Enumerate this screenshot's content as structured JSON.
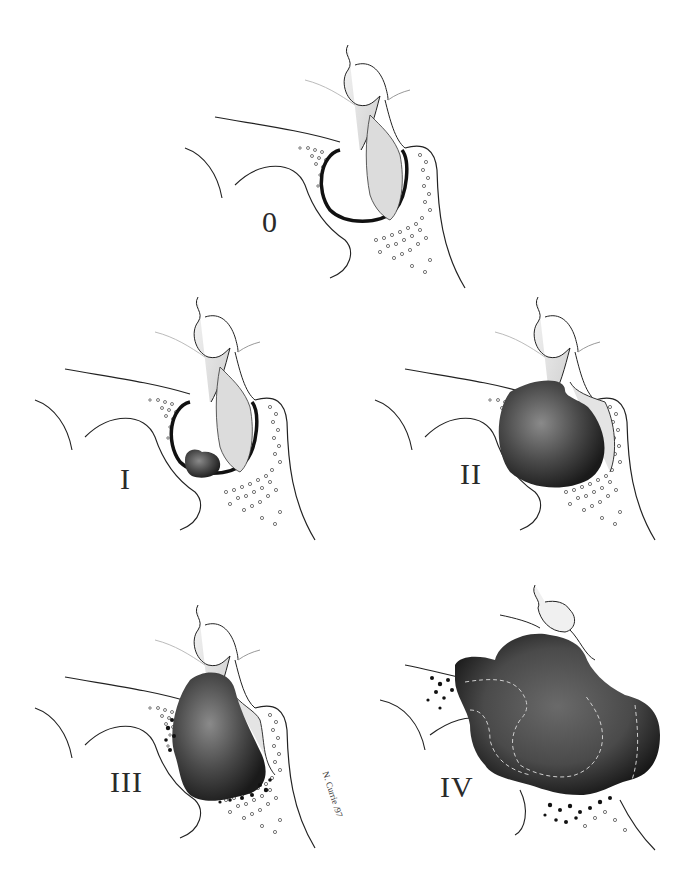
{
  "figure": {
    "panels": [
      {
        "id": "stage-0",
        "label": "0",
        "tumor": "none"
      },
      {
        "id": "stage-I",
        "label": "I",
        "tumor": "small"
      },
      {
        "id": "stage-II",
        "label": "II",
        "tumor": "enlarged-sella"
      },
      {
        "id": "stage-III",
        "label": "III",
        "tumor": "local-invasion"
      },
      {
        "id": "stage-IV",
        "label": "IV",
        "tumor": "diffuse-invasion"
      }
    ],
    "signature": "N. Currie /97",
    "colors": {
      "background": "#ffffff",
      "line": "#1e1e1e",
      "gland_fill": "#e6e6e6",
      "tumor_dark": "#2a2a2a",
      "tumor_mid": "#5a5a5a",
      "dots": "#555555"
    }
  }
}
